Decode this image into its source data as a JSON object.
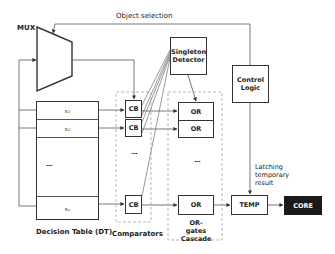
{
  "diagram": {
    "labels": {
      "mux": "MUX",
      "object_selection": "Object selection",
      "decision_table": "Decision Table (DT)",
      "comparators": "Comparators",
      "or_cascade_line1": "OR-gates",
      "or_cascade_line2": "Cascade",
      "latching_line1": "Latching",
      "latching_line2": "temporary",
      "latching_line3": "result"
    },
    "blocks": {
      "singleton_line1": "Singleton",
      "singleton_line2": "Detector",
      "control_line1": "Control",
      "control_line2": "Logic",
      "temp": "TEMP",
      "core": "CORE"
    },
    "decision_table_rows": [
      {
        "label": "x₁"
      },
      {
        "label": "x₂"
      },
      {
        "label": "⋮"
      },
      {
        "label": "xₙ"
      }
    ],
    "comparators": [
      "CB",
      "CB",
      "CB"
    ],
    "or_gates": [
      "OR",
      "OR",
      "OR"
    ],
    "ellipsis": "⋮"
  }
}
